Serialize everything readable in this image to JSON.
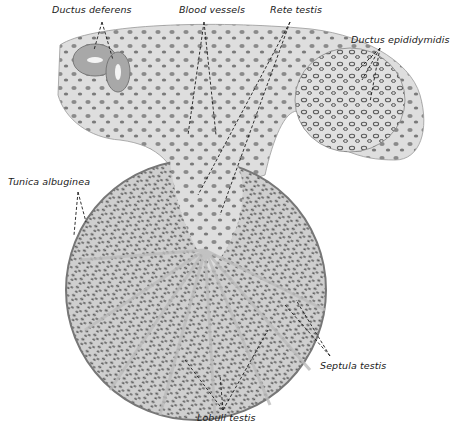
{
  "figure": {
    "background": "#ffffff",
    "tissue_color": "#d9d9d9",
    "tubule_color": "#6f6f6f",
    "ink_color": "#1a1a1a"
  },
  "labels": [
    {
      "id": "ductus-deferens",
      "text": "Ductus deferens",
      "x": 52,
      "y": 4
    },
    {
      "id": "blood-vessels",
      "text": "Blood vessels",
      "x": 179,
      "y": 4
    },
    {
      "id": "rete-testis",
      "text": "Rete testis",
      "x": 270,
      "y": 4
    },
    {
      "id": "ductus-epididymidis",
      "text": "Ductus epididymidis",
      "x": 351,
      "y": 34
    },
    {
      "id": "tunica-albuginea",
      "text": "Tunica albuginea",
      "x": 8,
      "y": 176
    },
    {
      "id": "septula-testis",
      "text": "Septula testis",
      "x": 320,
      "y": 360
    },
    {
      "id": "lobuli-testis",
      "text": "Lobuli testis",
      "x": 197,
      "y": 412
    }
  ]
}
